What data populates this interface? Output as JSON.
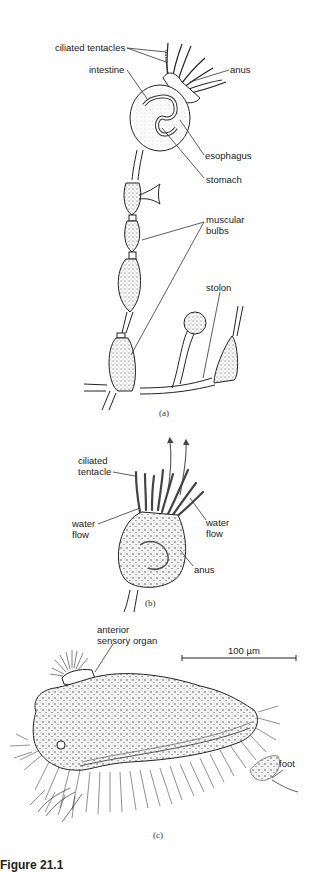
{
  "figure": {
    "caption_partial": "Figure 21.1",
    "panels": [
      {
        "id": "a",
        "label": "(a)",
        "annotations": [
          {
            "text": "ciliated tentacles"
          },
          {
            "text": "intestine"
          },
          {
            "text": "anus"
          },
          {
            "text": "esophagus"
          },
          {
            "text": "stomach"
          },
          {
            "text": "muscular\nbulbs",
            "line1": "muscular",
            "line2": "bulbs"
          },
          {
            "text": "stolon"
          }
        ]
      },
      {
        "id": "b",
        "label": "(b)",
        "annotations": [
          {
            "line1": "ciliated",
            "line2": "tentacle"
          },
          {
            "line1": "water",
            "line2": "flow"
          },
          {
            "line1": "water",
            "line2": "flow"
          },
          {
            "text": "anus"
          }
        ]
      },
      {
        "id": "c",
        "label": "(c)",
        "annotations": [
          {
            "line1": "anterior",
            "line2": "sensory organ"
          },
          {
            "text": "foot"
          }
        ],
        "scale_bar": {
          "label": "100 µm"
        }
      }
    ]
  }
}
